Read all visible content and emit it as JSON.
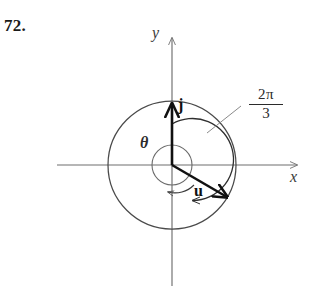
{
  "problem": {
    "number": "72."
  },
  "figure": {
    "type": "vector-diagram",
    "axes": {
      "x_label": "x",
      "y_label": "y"
    },
    "vectors": [
      {
        "name": "j",
        "label": "j",
        "direction": "up",
        "angle_deg": 90
      },
      {
        "name": "u",
        "label": "u",
        "direction": "down-right",
        "angle_deg": -30
      }
    ],
    "angles": [
      {
        "name": "rotation-angle",
        "numerator": "2π",
        "denominator": "3",
        "value": "2π/3",
        "sweep": "clockwise",
        "from": "j",
        "to": "u"
      },
      {
        "name": "theta",
        "label": "θ",
        "sweep": "counterclockwise",
        "from": "u",
        "to": "positive-x-axis"
      }
    ],
    "circles": [
      {
        "name": "outer-circle",
        "radius": 64
      },
      {
        "name": "inner-circle",
        "radius": 20
      }
    ],
    "colors": {
      "axis": "#6e6e6e",
      "circle": "#4a4a4a",
      "vector": "#111111",
      "arc": "#2f2f2f",
      "leader": "#7a7a7a",
      "text": "#1a1a1a",
      "background": "#ffffff"
    }
  }
}
